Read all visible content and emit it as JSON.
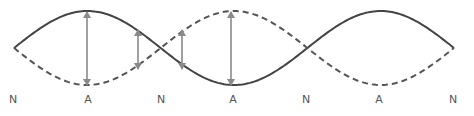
{
  "diagram": {
    "colors": {
      "solid_wave": "#444444",
      "dashed_wave": "#555555",
      "arrow": "#8a8a8a",
      "label": "#555555"
    },
    "wave": {
      "axis_y": 48,
      "amplitude": 37,
      "x_start": 14,
      "x_end": 454,
      "half_wavelength": 146.67
    },
    "arrows": [
      {
        "x": 87,
        "y1": 11,
        "y2": 86
      },
      {
        "x": 138,
        "y1": 29,
        "y2": 70
      },
      {
        "x": 182,
        "y1": 29,
        "y2": 70
      },
      {
        "x": 231,
        "y1": 11,
        "y2": 86
      }
    ],
    "labels": [
      {
        "text": "N",
        "x": 13
      },
      {
        "text": "A",
        "x": 88
      },
      {
        "text": "N",
        "x": 161
      },
      {
        "text": "A",
        "x": 233
      },
      {
        "text": "N",
        "x": 306
      },
      {
        "text": "A",
        "x": 379
      },
      {
        "text": "N",
        "x": 453
      }
    ]
  }
}
